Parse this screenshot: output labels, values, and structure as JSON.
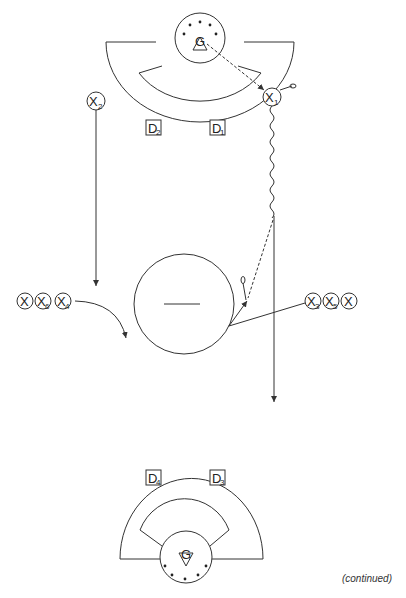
{
  "diagram": {
    "type": "hockey-drill",
    "top_goal": {
      "goalie_label": "G",
      "defenders": [
        {
          "label": "D",
          "sub": "2"
        },
        {
          "label": "D",
          "sub": "1"
        }
      ]
    },
    "bottom_goal": {
      "goalie_label": "G",
      "defenders": [
        {
          "label": "D",
          "sub": "4"
        },
        {
          "label": "D",
          "sub": "3"
        }
      ]
    },
    "players": {
      "x1": {
        "label": "X",
        "sub": "1"
      },
      "x2": {
        "label": "X",
        "sub": "2"
      },
      "left_line": [
        {
          "label": "X",
          "sub": ""
        },
        {
          "label": "X",
          "sub": "6"
        },
        {
          "label": "X",
          "sub": "4"
        }
      ],
      "right_line": [
        {
          "label": "X",
          "sub": "3"
        },
        {
          "label": "X",
          "sub": "5"
        },
        {
          "label": "X",
          "sub": ""
        }
      ]
    },
    "center_circle": {
      "mark": "faceoff-line"
    },
    "caption": "(continued)",
    "colors": {
      "line": "#333333",
      "background": "#ffffff"
    }
  }
}
